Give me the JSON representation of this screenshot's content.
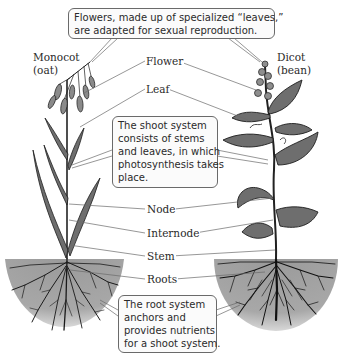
{
  "diagram": {
    "plants": {
      "monocot": {
        "name": "Monocot",
        "example": "(oat)"
      },
      "dicot": {
        "name": "Dicot",
        "example": "(bean)"
      }
    },
    "labels": {
      "flower": "Flower",
      "leaf": "Leaf",
      "node": "Node",
      "internode": "Internode",
      "stem": "Stem",
      "roots": "Roots"
    },
    "callouts": {
      "flowers": {
        "lines": [
          "Flowers, made up of specialized “leaves,”",
          "are adapted for sexual reproduction."
        ]
      },
      "shoot_system": {
        "lines": [
          "The shoot system",
          "consists of stems",
          "and leaves, in which",
          "photosynthesis takes",
          "place."
        ]
      },
      "root_system": {
        "lines": [
          "The root system",
          "anchors and",
          "provides nutrients",
          "for a shoot system."
        ]
      }
    },
    "colors": {
      "soil": "#a3a3a3",
      "leaf_fill": "#6e6e6e",
      "stroke": "#1e1e1e",
      "leader_line": "#6a6a6a",
      "callout_border": "#6a6a6a"
    }
  }
}
